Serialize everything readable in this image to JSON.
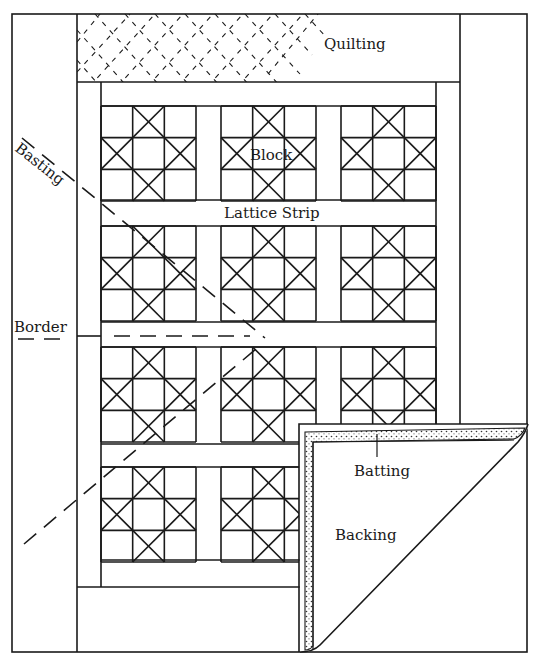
{
  "diagram": {
    "labels": {
      "quilting": "Quilting",
      "basting": "Basting",
      "block": "Block",
      "lattice_strip": "Lattice Strip",
      "border": "Border",
      "batting": "Batting",
      "backing": "Backing"
    },
    "grid": {
      "block_rows": 4,
      "block_columns": 3,
      "block_pattern": "Ohio Star (3x3 with crossed squares)"
    },
    "colors": {
      "ink": "#1a1a1a",
      "paper": "#ffffff",
      "batting_fill": "#f2f2f2"
    }
  }
}
